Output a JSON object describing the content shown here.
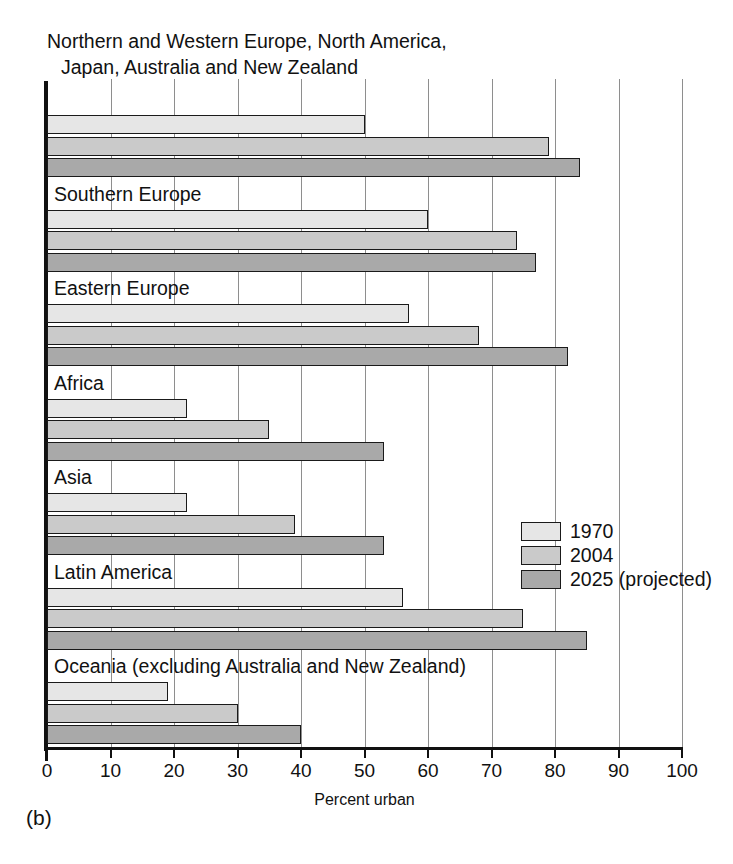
{
  "figure": {
    "label": "(b)",
    "header_line1": "Northern and Western Europe, North America,",
    "header_line2": "Japan, Australia and New Zealand"
  },
  "legend": {
    "position": "inside-right",
    "items": [
      {
        "label": "1970",
        "color": "#e6e6e6"
      },
      {
        "label": "2004",
        "color": "#cacaca"
      },
      {
        "label": "2025 (projected)",
        "color": "#a9a9a9"
      }
    ]
  },
  "chart_data": {
    "type": "bar",
    "orientation": "horizontal",
    "title": "",
    "xlabel": "Percent urban",
    "ylabel": "",
    "xlim": [
      0,
      100
    ],
    "grid": true,
    "xticks": [
      0,
      10,
      20,
      30,
      40,
      50,
      60,
      70,
      80,
      90,
      100
    ],
    "xticklabels": [
      "0",
      "10",
      "20",
      "30",
      "40",
      "50",
      "60",
      "70",
      "80",
      "90",
      "100"
    ],
    "categories": [
      "Northern and Western Europe, North America, Japan, Australia and New Zealand",
      "Southern Europe",
      "Eastern Europe",
      "Africa",
      "Asia",
      "Latin America",
      "Oceania (excluding Australia and New Zealand)"
    ],
    "category_labels_inside_plot": [
      "Northern and Western Europe, North America,\nJapan, Australia and New Zealand",
      "Southern Europe",
      "Eastern Europe",
      "Africa",
      "Asia",
      "Latin America",
      "Oceania (excluding Australia and New Zealand)"
    ],
    "series": [
      {
        "name": "1970",
        "color": "#e6e6e6",
        "values": [
          50,
          60,
          57,
          22,
          22,
          56,
          19
        ]
      },
      {
        "name": "2004",
        "color": "#cacaca",
        "values": [
          79,
          74,
          68,
          35,
          39,
          75,
          30
        ]
      },
      {
        "name": "2025 (projected)",
        "color": "#a9a9a9",
        "values": [
          84,
          77,
          82,
          53,
          53,
          85,
          40
        ]
      }
    ]
  }
}
